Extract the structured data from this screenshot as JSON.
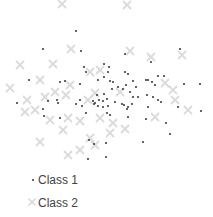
{
  "chart_data": {
    "type": "scatter",
    "title": "",
    "xlabel": "",
    "ylabel": "",
    "axes_visible": false,
    "grid": false,
    "legend": {
      "position": "bottom-left",
      "entries": [
        {
          "label": "Class 1",
          "marker": "dot",
          "color": "#404040"
        },
        {
          "label": "Class 2",
          "marker": "x",
          "color": "#d0d0d0"
        }
      ]
    },
    "xlim": [
      0,
      213
    ],
    "ylim": [
      0,
      170
    ],
    "series": [
      {
        "name": "Class 1",
        "marker": "dot",
        "color": "#404040",
        "points": [
          [
            76,
            31
          ],
          [
            43,
            49
          ],
          [
            81,
            51
          ],
          [
            125,
            54
          ],
          [
            180,
            49
          ],
          [
            151,
            62
          ],
          [
            84,
            67
          ],
          [
            86,
            72
          ],
          [
            104,
            64
          ],
          [
            109,
            67
          ],
          [
            108,
            72
          ],
          [
            104,
            77
          ],
          [
            128,
            74
          ],
          [
            125,
            72
          ],
          [
            29,
            80
          ],
          [
            60,
            82
          ],
          [
            65,
            81
          ],
          [
            80,
            84
          ],
          [
            98,
            80
          ],
          [
            110,
            81
          ],
          [
            113,
            82
          ],
          [
            146,
            80
          ],
          [
            152,
            82
          ],
          [
            148,
            80
          ],
          [
            158,
            76
          ],
          [
            164,
            76
          ],
          [
            133,
            81
          ],
          [
            126,
            85
          ],
          [
            118,
            87
          ],
          [
            112,
            89
          ],
          [
            123,
            89
          ],
          [
            136,
            87
          ],
          [
            155,
            85
          ],
          [
            130,
            92
          ],
          [
            133,
            97
          ],
          [
            138,
            97
          ],
          [
            147,
            95
          ],
          [
            184,
            84
          ],
          [
            200,
            84
          ],
          [
            17,
            103
          ],
          [
            48,
            101
          ],
          [
            57,
            100
          ],
          [
            58,
            103
          ],
          [
            76,
            104
          ],
          [
            80,
            100
          ],
          [
            82,
            106
          ],
          [
            93,
            101
          ],
          [
            97,
            95
          ],
          [
            95,
            103
          ],
          [
            99,
            100
          ],
          [
            103,
            101
          ],
          [
            104,
            94
          ],
          [
            107,
            99
          ],
          [
            94,
            104
          ],
          [
            98,
            106
          ],
          [
            103,
            107
          ],
          [
            108,
            106
          ],
          [
            115,
            102
          ],
          [
            122,
            104
          ],
          [
            124,
            105
          ],
          [
            128,
            107
          ],
          [
            132,
            104
          ],
          [
            127,
            109
          ],
          [
            148,
            107
          ],
          [
            153,
            97
          ],
          [
            158,
            100
          ],
          [
            161,
            102
          ],
          [
            178,
            107
          ],
          [
            201,
            111
          ],
          [
            43,
            109
          ],
          [
            44,
            116
          ],
          [
            60,
            118
          ],
          [
            86,
            113
          ],
          [
            107,
            113
          ],
          [
            110,
            115
          ],
          [
            128,
            117
          ],
          [
            146,
            119
          ],
          [
            166,
            123
          ],
          [
            170,
            134
          ],
          [
            143,
            142
          ],
          [
            89,
            140
          ],
          [
            94,
            144
          ],
          [
            106,
            143
          ],
          [
            88,
            159
          ],
          [
            106,
            157
          ]
        ]
      },
      {
        "name": "Class 2",
        "marker": "x",
        "color": "#d0d0d0",
        "points": [
          [
            62,
            4
          ],
          [
            127,
            5
          ],
          [
            20,
            65
          ],
          [
            53,
            64
          ],
          [
            71,
            49
          ],
          [
            130,
            51
          ],
          [
            151,
            57
          ],
          [
            182,
            55
          ],
          [
            40,
            80
          ],
          [
            55,
            92
          ],
          [
            70,
            85
          ],
          [
            90,
            72
          ],
          [
            100,
            70
          ],
          [
            165,
            83
          ],
          [
            10,
            88
          ],
          [
            27,
            100
          ],
          [
            45,
            97
          ],
          [
            66,
            95
          ],
          [
            95,
            93
          ],
          [
            88,
            100
          ],
          [
            120,
            92
          ],
          [
            173,
            90
          ],
          [
            175,
            100
          ],
          [
            25,
            112
          ],
          [
            35,
            110
          ],
          [
            50,
            120
          ],
          [
            68,
            118
          ],
          [
            80,
            121
          ],
          [
            100,
            118
          ],
          [
            113,
            123
          ],
          [
            155,
            117
          ],
          [
            188,
            110
          ],
          [
            125,
            129
          ],
          [
            40,
            142
          ],
          [
            63,
            130
          ],
          [
            90,
            138
          ],
          [
            95,
            145
          ],
          [
            110,
            133
          ],
          [
            68,
            155
          ],
          [
            80,
            150
          ]
        ]
      }
    ]
  }
}
